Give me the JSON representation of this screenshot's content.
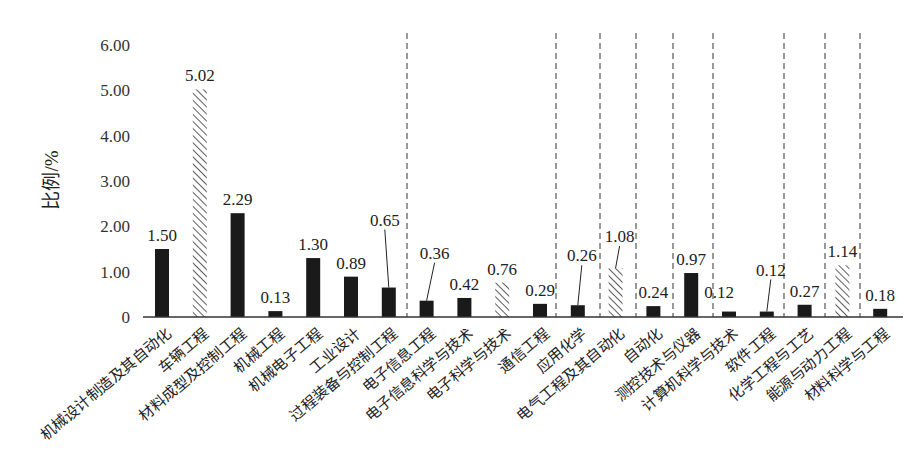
{
  "chart_data": {
    "type": "bar",
    "title": "",
    "xlabel": "",
    "ylabel": "比例/%",
    "ylim": [
      0,
      6
    ],
    "yticks": [
      "0",
      "1.00",
      "2.00",
      "3.00",
      "4.00",
      "5.00",
      "6.00"
    ],
    "grid": false,
    "legend": null,
    "categories": [
      "机械设计制造及其自动化",
      "车辆工程",
      "材料成型及控制工程",
      "机械工程",
      "机械电子工程",
      "工业设计",
      "过程装备与控制工程",
      "电子信息工程",
      "电子信息科学与技术",
      "电子科学与技术",
      "通信工程",
      "应用化学",
      "电气工程及其自动化",
      "自动化",
      "测控技术与仪器",
      "计算机科学与技术",
      "软件工程",
      "化学工程与工艺",
      "能源与动力工程",
      "材料科学与工程"
    ],
    "values": [
      1.5,
      5.02,
      2.29,
      0.13,
      1.3,
      0.89,
      0.65,
      0.36,
      0.42,
      0.76,
      0.29,
      0.26,
      1.08,
      0.24,
      0.97,
      0.12,
      0.12,
      0.27,
      1.14,
      0.18
    ],
    "value_labels": [
      "1.50",
      "5.02",
      "2.29",
      "0.13",
      "1.30",
      "0.89",
      "0.65",
      "0.36",
      "0.42",
      "0.76",
      "0.29",
      "0.26",
      "1.08",
      "0.24",
      "0.97",
      "0.12",
      "0.12",
      "0.27",
      "1.14",
      "0.18"
    ],
    "bar_style": [
      "solid",
      "hatched",
      "solid",
      "solid",
      "solid",
      "solid",
      "solid",
      "solid",
      "solid",
      "hatched",
      "solid",
      "solid",
      "hatched",
      "solid",
      "solid",
      "solid",
      "solid",
      "solid",
      "hatched",
      "solid"
    ],
    "group_separators_after_index": [
      6,
      10,
      11,
      12,
      13,
      14,
      16,
      17,
      18
    ],
    "colors": {
      "solid": "#1a1a1a",
      "hatched": "#333333",
      "axis": "#333333",
      "separator": "#555555"
    }
  }
}
